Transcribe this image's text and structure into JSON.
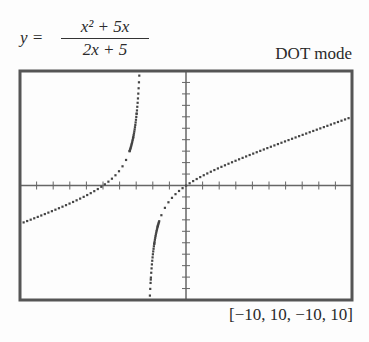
{
  "equation": {
    "lhs": "y =",
    "numerator": "x² + 5x",
    "denominator": "2x + 5"
  },
  "mode_label": "DOT mode",
  "window_label": "[−10, 10, −10, 10]",
  "colors": {
    "frame": "#555555",
    "axes": "#666666",
    "dots": "#444444"
  },
  "chart_data": {
    "type": "scatter",
    "function": "(x^2+5x)/(2x+5)",
    "mode": "DOT",
    "xlim": [
      -10,
      10
    ],
    "ylim": [
      -10,
      10
    ],
    "xscale": 1,
    "yscale": 1,
    "vertical_asymptote": -2.5,
    "grid": false,
    "series": [
      {
        "name": "left branch",
        "x": [
          -10,
          -8,
          -6,
          -5,
          -4,
          -3,
          -2.8,
          -2.7
        ],
        "y": [
          -3.33,
          -2.18,
          -0.86,
          0,
          1.33,
          6,
          10.27,
          15.53
        ]
      },
      {
        "name": "right branch",
        "x": [
          -2.3,
          -2.2,
          -2,
          -1,
          0,
          2,
          4,
          6,
          8,
          10
        ],
        "y": [
          -15.53,
          -10.27,
          -6,
          -1.33,
          0,
          1.56,
          2.77,
          3.88,
          4.95,
          6
        ]
      }
    ],
    "xlabel": "",
    "ylabel": ""
  }
}
